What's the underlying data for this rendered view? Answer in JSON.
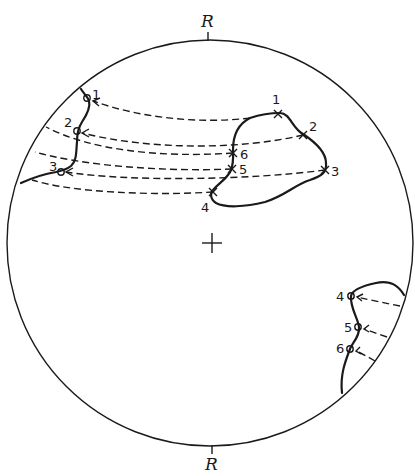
{
  "diagram": {
    "type": "stereographic-projection-rotation",
    "axis_labels": {
      "top": "R",
      "bottom": "R"
    },
    "center_marker": "+",
    "source_points": {
      "symbol": "x",
      "labels": [
        "1",
        "2",
        "3",
        "4",
        "5",
        "6"
      ]
    },
    "rotated_points_upper_left": {
      "symbol": "o",
      "labels": [
        "1",
        "2",
        "3"
      ]
    },
    "rotated_points_lower_right": {
      "symbol": "o",
      "labels": [
        "4",
        "5",
        "6"
      ]
    },
    "colors": {
      "ink": "#1a1a1a",
      "background": "#ffffff"
    }
  }
}
